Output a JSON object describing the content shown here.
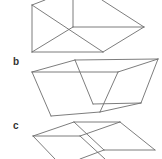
{
  "figure": {
    "panels": [
      {
        "label": "",
        "description": "box with diagonals",
        "edges": [
          [
            32,
            5,
            45,
            0
          ],
          [
            32,
            5,
            32,
            52
          ],
          [
            32,
            52,
            103,
            52
          ],
          [
            32,
            5,
            103,
            52
          ],
          [
            32,
            52,
            73,
            27
          ],
          [
            73,
            0,
            73,
            27
          ],
          [
            73,
            27,
            144,
            27
          ],
          [
            103,
            52,
            144,
            27
          ],
          [
            102,
            0,
            144,
            27
          ]
        ]
      },
      {
        "label": "b",
        "description": "sheared box",
        "edges": [
          [
            32,
            72,
            75,
            60
          ],
          [
            75,
            60,
            158,
            59
          ],
          [
            32,
            72,
            118,
            72
          ],
          [
            118,
            72,
            158,
            59
          ],
          [
            32,
            72,
            51,
            116
          ],
          [
            75,
            60,
            93,
            104
          ],
          [
            118,
            72,
            100,
            112
          ],
          [
            158,
            59,
            141,
            103
          ],
          [
            93,
            104,
            141,
            103
          ],
          [
            51,
            116,
            100,
            112
          ],
          [
            100,
            112,
            141,
            103
          ]
        ]
      },
      {
        "label": "c",
        "description": "flattened sheared box",
        "edges": [
          [
            33,
            136,
            74,
            122
          ],
          [
            74,
            122,
            120,
            122
          ],
          [
            33,
            136,
            80,
            136
          ],
          [
            80,
            136,
            120,
            122
          ],
          [
            74,
            122,
            104,
            150
          ],
          [
            120,
            122,
            155,
            150
          ],
          [
            104,
            150,
            155,
            150
          ],
          [
            33,
            136,
            55,
            159
          ],
          [
            80,
            136,
            105,
            159
          ],
          [
            80,
            159,
            104,
            150
          ]
        ]
      }
    ],
    "stroke_color": "#6e6e6e",
    "label_color": "#333333"
  }
}
